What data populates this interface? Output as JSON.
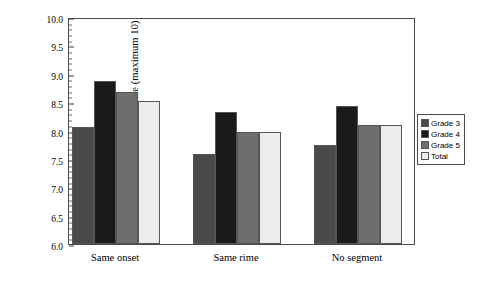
{
  "chart_data": {
    "type": "bar",
    "title": "",
    "subtitle": "",
    "xlabel": "",
    "ylabel": "Mean score (maximum 10)",
    "categories": [
      "Same onset",
      "Same rime",
      "No segment"
    ],
    "series": [
      {
        "name": "Grade 3",
        "color": "#4a4a4a",
        "values": [
          8.06,
          7.59,
          7.75
        ]
      },
      {
        "name": "Grade 4",
        "color": "#1a1a1a",
        "values": [
          8.87,
          8.32,
          8.44
        ]
      },
      {
        "name": "Grade 5",
        "color": "#6e6e6e",
        "values": [
          8.68,
          7.98,
          8.09
        ]
      },
      {
        "name": "Total",
        "color": "#ececec",
        "values": [
          8.52,
          7.97,
          8.09
        ]
      }
    ],
    "ylim": [
      6.0,
      10.0
    ],
    "y_tick_labels": [
      "10.0",
      "9.5",
      "9.0",
      "8.5",
      "8.0",
      "7.5",
      "7.0",
      "6.5",
      "6.0"
    ],
    "y_tick_values": [
      10.0,
      9.5,
      9.0,
      8.5,
      8.0,
      7.5,
      7.0,
      6.5,
      6.0
    ],
    "y_minor_tick_step": 0.1,
    "grid": false,
    "legend_position": "right"
  },
  "legend": {
    "items": [
      {
        "label": "Grade 3",
        "color": "#4a4a4a"
      },
      {
        "label": "Grade 4",
        "color": "#1a1a1a"
      },
      {
        "label": "Grade 5",
        "color": "#6e6e6e"
      },
      {
        "label": "Total",
        "color": "#ececec"
      }
    ]
  }
}
